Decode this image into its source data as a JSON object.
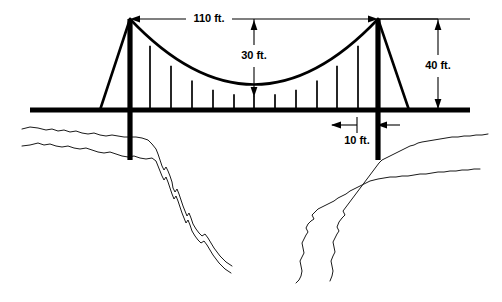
{
  "figure": {
    "background_color": "#ffffff",
    "ink_color": "#000000"
  },
  "dimensions": {
    "span": {
      "label": "110 ft.",
      "value": 110,
      "unit": "ft.",
      "description": "horizontal distance between the two tower tops",
      "orientation": "horizontal"
    },
    "sag": {
      "label": "30 ft.",
      "value": 30,
      "unit": "ft.",
      "description": "vertical drop from the cable dimension line down to the lowest point of the main cable",
      "orientation": "vertical"
    },
    "tower_height": {
      "label": "40 ft.",
      "value": 40,
      "unit": "ft.",
      "description": "vertical height from the roadway deck up to the top of the tower",
      "orientation": "vertical"
    },
    "offset": {
      "label": "10 ft.",
      "value": 10,
      "unit": "ft.",
      "description": "short horizontal dimension below the deck at the right tower",
      "orientation": "horizontal"
    }
  },
  "structure": {
    "deck_label": "roadway deck",
    "left_tower_label": "left tower",
    "right_tower_label": "right tower",
    "main_cable_label": "main suspension cable",
    "hanger_count": 11,
    "left_anchor_label": "left anchor cable",
    "right_anchor_label": "right anchor cable"
  },
  "terrain": {
    "left_label": "left canyon wall",
    "right_label": "right canyon wall"
  }
}
